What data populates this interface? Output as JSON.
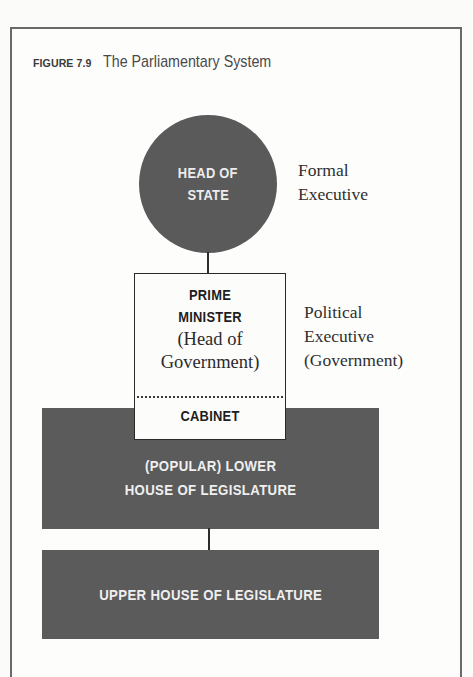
{
  "figure": {
    "number": "FIGURE 7.9",
    "title": "The Parliamentary System"
  },
  "nodes": {
    "head_of_state": {
      "line1": "HEAD OF",
      "line2": "STATE"
    },
    "prime_minister": {
      "title_line1": "PRIME",
      "title_line2": "MINISTER",
      "sub_line1": "(Head of",
      "sub_line2": "Government)",
      "cabinet": "CABINET"
    },
    "lower_house": {
      "line1": "(POPULAR) LOWER",
      "line2": "HOUSE OF LEGISLATURE"
    },
    "upper_house": {
      "line1": "UPPER HOUSE OF LEGISLATURE"
    }
  },
  "labels": {
    "formal_executive": {
      "line1": "Formal",
      "line2": "Executive"
    },
    "political_executive": {
      "line1": "Political",
      "line2": "Executive",
      "line3": "(Government)"
    }
  },
  "colors": {
    "node_fill": "#5a5a5a",
    "node_text": "#efefef",
    "frame_border": "#6a6a6a",
    "background": "#fbfbfa"
  }
}
